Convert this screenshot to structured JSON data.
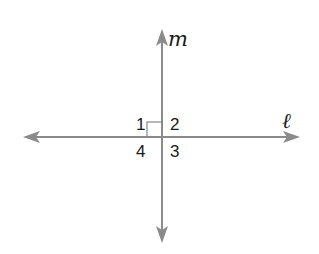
{
  "diagram": {
    "lines": [
      {
        "name": "m",
        "label": "𝑚",
        "orientation": "vertical"
      },
      {
        "name": "l",
        "label": "ℓ",
        "orientation": "horizontal"
      }
    ],
    "angles": [
      {
        "label": "1",
        "position": "upper-left"
      },
      {
        "label": "2",
        "position": "upper-right"
      },
      {
        "label": "3",
        "position": "lower-right"
      },
      {
        "label": "4",
        "position": "lower-left"
      }
    ],
    "right_angle_marker": "angle 1",
    "colors": {
      "line": "#8a8a8a",
      "text": "#1a1a1a",
      "marker": "#8a8a8a"
    }
  }
}
